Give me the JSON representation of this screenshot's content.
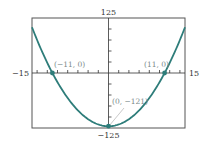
{
  "chart_data": {
    "type": "line",
    "title": "",
    "xlabel": "",
    "ylabel": "",
    "function": "y = x^2 - 121",
    "xlim": [
      -15,
      15
    ],
    "ylim": [
      -125,
      125
    ],
    "grid": false,
    "x_tick_step": 2,
    "y_tick_step": 25,
    "axis_labels": {
      "xmin": "−15",
      "xmax": "15",
      "ymin": "−125",
      "ymax": "125"
    },
    "series": [
      {
        "name": "parabola",
        "color": "#2e7d7a",
        "x": [
          -15,
          -13,
          -11,
          -9,
          -7,
          -5,
          -3,
          -1,
          0,
          1,
          3,
          5,
          7,
          9,
          11,
          13,
          15
        ],
        "y": [
          104,
          48,
          0,
          -40,
          -72,
          -96,
          -112,
          -120,
          -121,
          -120,
          -112,
          -96,
          -72,
          -40,
          0,
          48,
          104
        ]
      }
    ],
    "annotations": [
      {
        "label": "(−11, 0)",
        "x": -11,
        "y": 0
      },
      {
        "label": "(11, 0)",
        "x": 11,
        "y": 0
      },
      {
        "label": "(0, −121)",
        "x": 0,
        "y": -121
      }
    ]
  }
}
